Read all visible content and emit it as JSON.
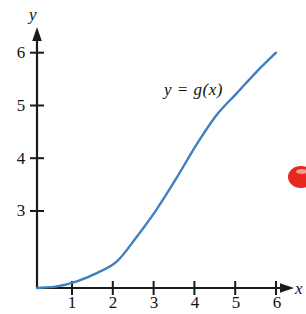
{
  "chart_data": {
    "type": "line",
    "title": "",
    "subtitle": "",
    "xlabel": "x",
    "ylabel": "y",
    "xlim": [
      0,
      6.4
    ],
    "ylim": [
      0,
      6.4
    ],
    "grid": false,
    "legend_position": "inline-annotation",
    "annotations": [
      {
        "text": "y = g(x)",
        "x": 3.1,
        "y": 5.1
      }
    ],
    "x_ticks": [
      1,
      2,
      3,
      4,
      5,
      6
    ],
    "x_tick_labels": [
      "1",
      "2",
      "3",
      "4",
      "5",
      "6"
    ],
    "y_ticks": [
      3,
      4,
      5,
      6
    ],
    "y_tick_labels": [
      "3",
      "4",
      "5",
      "6"
    ],
    "series": [
      {
        "name": "y = g(x)",
        "color": "#3f7fbf",
        "x": [
          0,
          0.5,
          1,
          1.5,
          2,
          2.5,
          3,
          3.5,
          4,
          4.5,
          5,
          5.5,
          6
        ],
        "values": [
          0,
          0.04,
          0.17,
          0.38,
          0.67,
          1.3,
          2.0,
          2.8,
          3.65,
          4.4,
          4.95,
          5.5,
          6.0
        ]
      }
    ],
    "markers": [
      {
        "name": "red-ellipse-marker",
        "color": "#e8271f",
        "x": 6.9,
        "y": 3.85
      }
    ]
  },
  "figure": {
    "y_axis_name": "y",
    "x_axis_name": "x",
    "curve_equation": "y = g(x)",
    "y_tick_labels": [
      "6",
      "5",
      "4",
      "3"
    ],
    "x_tick_labels": [
      "1",
      "2",
      "3",
      "4",
      "5",
      "6"
    ],
    "colors": {
      "curve": "#3f7fbf",
      "axis": "#1a1a1a",
      "text": "#111111",
      "marker": "#e8271f",
      "background": "#ffffff"
    }
  }
}
